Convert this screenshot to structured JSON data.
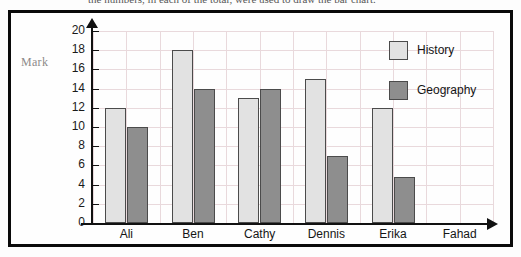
{
  "caption": {
    "text": "the numbers, in each of the total, were used to draw the bar chart."
  },
  "colors": {
    "history": "#e2e2e2",
    "geography": "#8e8e8e",
    "bar_outline": "#4b4b4b",
    "grid": "#e9d9dc",
    "axis": "#111111",
    "frame": "#0a0a0a",
    "mark_label": "#8d8a8a"
  },
  "legend": {
    "position": "top-right",
    "entries": [
      {
        "label": "History",
        "color": "#e2e2e2"
      },
      {
        "label": "Geography",
        "color": "#8e8e8e"
      }
    ]
  },
  "chart_data": {
    "type": "bar",
    "title": "",
    "xlabel": "",
    "ylabel": "Mark",
    "ylim": [
      0,
      20
    ],
    "ytick_step": 2,
    "yticks": [
      20,
      18,
      16,
      14,
      12,
      10,
      8,
      6,
      4,
      2,
      0
    ],
    "grid": true,
    "grid_axis": "both",
    "legend_position": "top-right",
    "categories": [
      "Ali",
      "Ben",
      "Cathy",
      "Dennis",
      "Erika",
      "Fahad"
    ],
    "series": [
      {
        "name": "History",
        "values": [
          12,
          18,
          13,
          15,
          12,
          null
        ]
      },
      {
        "name": "Geography",
        "values": [
          10,
          14,
          14,
          7,
          4.8,
          null
        ]
      }
    ]
  }
}
